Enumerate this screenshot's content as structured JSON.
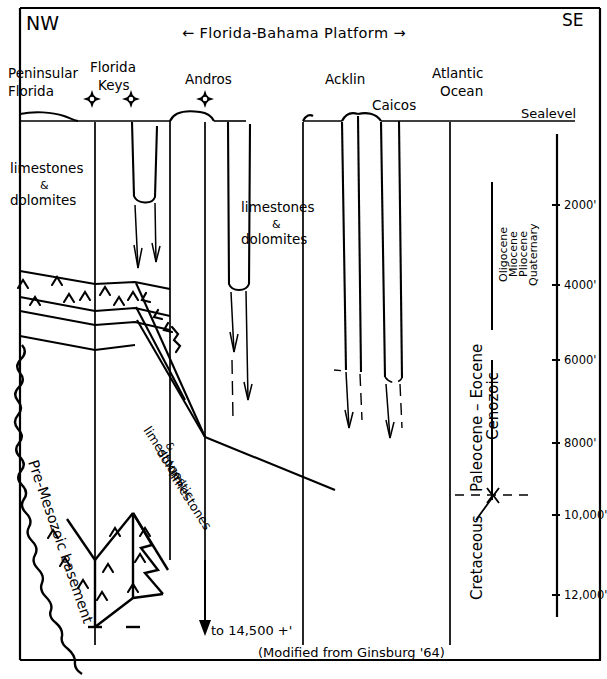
{
  "figure": {
    "orientation_left": "NW",
    "orientation_right": "SE",
    "platform_label": "← Florida-Bahama Platform →",
    "credit": "(Modified from Ginsburg '64)",
    "sealevel_label": "Sealevel",
    "depth_note": "to 14,500 +'"
  },
  "locations": [
    {
      "id": "peninsular-florida",
      "line1": "Peninsular",
      "line2": "Florida",
      "x": 8,
      "y": 74
    },
    {
      "id": "florida-keys",
      "line1": "Florida",
      "line2": "Keys",
      "x": 92,
      "y": 68
    },
    {
      "id": "andros",
      "line1": "Andros",
      "line2": "",
      "x": 186,
      "y": 81
    },
    {
      "id": "acklin",
      "line1": "Acklin",
      "line2": "",
      "x": 325,
      "y": 81
    },
    {
      "id": "caicos",
      "line1": "Caicos",
      "line2": "",
      "x": 373,
      "y": 105
    },
    {
      "id": "atlantic-ocean",
      "line1": "Atlantic",
      "line2": "Ocean",
      "x": 433,
      "y": 74
    }
  ],
  "well_markers": [
    {
      "id": "well-marker-keys-west",
      "x": 92,
      "y": 99
    },
    {
      "id": "well-marker-keys-east",
      "x": 131,
      "y": 99
    },
    {
      "id": "well-marker-andros",
      "x": 205,
      "y": 99
    }
  ],
  "units": [
    {
      "id": "limestones-dolomites-florida",
      "line1": "limestones",
      "amp": "&",
      "line2": "dolomites",
      "x": 10,
      "y": 168
    },
    {
      "id": "limestones-dolomites-bahama",
      "line1": "limestones",
      "amp": "&",
      "line2": "dolomites",
      "x": 241,
      "y": 200
    },
    {
      "id": "pre-mesozoic-basement",
      "text": "Pre-Mesozoic basement"
    },
    {
      "id": "limestones-dolomitic-limestones",
      "line1": "limestones",
      "amp": "&",
      "line2": "dolomitic",
      "line3": "limestones"
    }
  ],
  "depth_scale": {
    "unit": "feet",
    "ticks": [
      {
        "label": "2000'",
        "y": 205
      },
      {
        "label": "4000'",
        "y": 285
      },
      {
        "label": "6000'",
        "y": 360
      },
      {
        "label": "8000'",
        "y": 443
      },
      {
        "label": "10,000'",
        "y": 515
      },
      {
        "label": "12,000'",
        "y": 595
      }
    ]
  },
  "chronostratigraphy": {
    "epochs": [
      {
        "label": "Oligocene",
        "x": 503
      },
      {
        "label": "Miocene",
        "x": 512
      },
      {
        "label": "Pliocene",
        "x": 521
      },
      {
        "label": "Quaternary",
        "x": 530
      }
    ],
    "era": "Cenozoic",
    "series": "Paleocene – Eocene",
    "system": "Cretaceous"
  },
  "colors": {
    "ink": "#000000",
    "paper": "#ffffff"
  }
}
